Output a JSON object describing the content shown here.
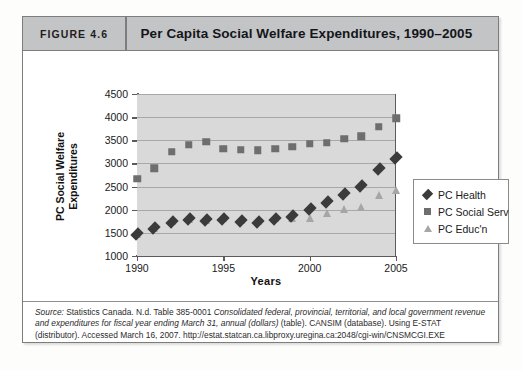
{
  "figure": {
    "number_label": "FIGURE 4.6",
    "title": "Per Capita Social Welfare Expenditures, 1990–2005"
  },
  "source": {
    "line1_prefix": "Source:",
    "line1_rest": " Statistics Canada. N.d. Table 385-0001 ",
    "italic1": "Consolidated federal, provincial, territorial, and local government revenue and expenditures for fiscal year ending March 31, annual (dollars)",
    "after_italic": " (table). CANSIM (database). Using E-STAT (distributor). Accessed March 16, 2007. ",
    "url": "http://estat.statcan.ca.libproxy.uregina.ca:2048/cgi-win/CNSMCGI.EXE"
  },
  "colors": {
    "header_bg": "#c3c4c6",
    "plot_bg": "#d9d9d9",
    "health": "#3b3b3b",
    "social_serv": "#6e6e6e",
    "education": "#a6a6a6",
    "frame": "#7d7d7d"
  },
  "chart_data": {
    "type": "scatter",
    "title": "Per Capita Social Welfare Expenditures, 1990–2005",
    "xlabel": "Years",
    "ylabel": "PC Social Welfare Expenditures",
    "xlim": [
      1990,
      2005
    ],
    "ylim": [
      1000,
      4500
    ],
    "ytick_step": 500,
    "yticks": [
      1000,
      1500,
      2000,
      2500,
      3000,
      3500,
      4000,
      4500
    ],
    "ytick_labels": [
      "1000",
      "1500",
      "2000",
      "2500",
      "3000",
      "3500",
      "4000",
      "4500"
    ],
    "xticks": [
      1990,
      1995,
      2000,
      2005
    ],
    "xtick_labels": [
      "1990",
      "1995",
      "2000",
      "2005"
    ],
    "grid": true,
    "legend_position": "right",
    "x": [
      1990,
      1991,
      1992,
      1993,
      1994,
      1995,
      1996,
      1997,
      1998,
      1999,
      2000,
      2001,
      2002,
      2003,
      2004,
      2005
    ],
    "series": [
      {
        "name": "PC Health",
        "marker": "diamond",
        "color": "#3b3b3b",
        "values": [
          1470,
          1600,
          1730,
          1790,
          1780,
          1790,
          1760,
          1740,
          1790,
          1860,
          2010,
          2160,
          2340,
          2510,
          2880,
          3125
        ]
      },
      {
        "name": "PC Social Serv",
        "marker": "square",
        "color": "#6e6e6e",
        "values": [
          2670,
          2900,
          3250,
          3400,
          3470,
          3320,
          3300,
          3290,
          3320,
          3360,
          3420,
          3450,
          3530,
          3590,
          3790,
          3975
        ]
      },
      {
        "name": "PC Educ'n",
        "marker": "triangle",
        "color": "#a6a6a6",
        "values": [
          1460,
          1590,
          1740,
          1770,
          1760,
          1790,
          1750,
          1730,
          1790,
          1800,
          1810,
          1900,
          1990,
          2030,
          2290,
          2400
        ]
      }
    ]
  }
}
